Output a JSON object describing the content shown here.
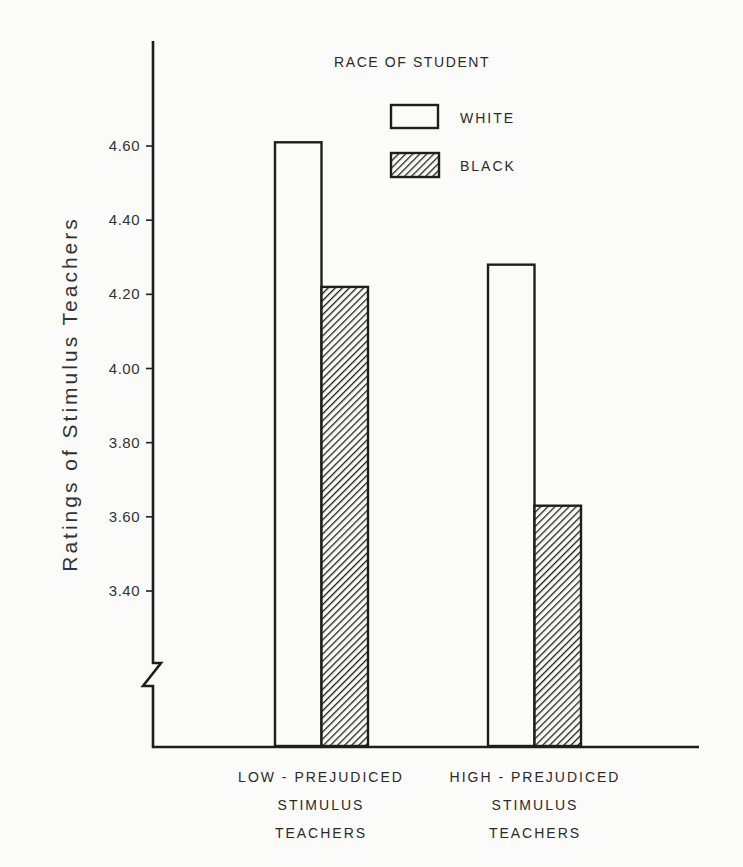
{
  "chart_data": {
    "type": "bar",
    "title": "",
    "xlabel": "",
    "ylabel": "Ratings of Stimulus Teachers",
    "ylim": [
      3.2,
      4.7
    ],
    "axis_break": true,
    "grid": false,
    "yticks": [
      "4.60",
      "4.40",
      "4.20",
      "4.00",
      "3.80",
      "3.60",
      "3.40"
    ],
    "categories": [
      [
        "LOW - PREJUDICED",
        "STIMULUS",
        "TEACHERS"
      ],
      [
        "HIGH - PREJUDICED",
        "STIMULUS",
        "TEACHERS"
      ]
    ],
    "legend": {
      "title": "RACE OF STUDENT",
      "position": "top-right",
      "entries": [
        {
          "label": "WHITE",
          "fill": "none"
        },
        {
          "label": "BLACK",
          "fill": "hatched"
        }
      ]
    },
    "series": [
      {
        "name": "WHITE",
        "values": [
          4.61,
          4.28
        ]
      },
      {
        "name": "BLACK",
        "values": [
          4.22,
          3.63
        ]
      }
    ]
  }
}
